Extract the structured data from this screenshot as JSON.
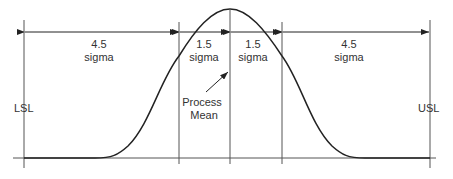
{
  "diagram": {
    "type": "six-sigma-normal-distribution",
    "colors": {
      "line": "#333333",
      "curve": "#222222",
      "background": "#ffffff"
    },
    "limits": {
      "lower": "LSL",
      "upper": "USL"
    },
    "segments": [
      {
        "value": "4.5",
        "unit": "sigma"
      },
      {
        "value": "1.5",
        "unit": "sigma"
      },
      {
        "value": "1.5",
        "unit": "sigma"
      },
      {
        "value": "4.5",
        "unit": "sigma"
      }
    ],
    "annotation": {
      "line1": "Process",
      "line2": "Mean"
    }
  }
}
